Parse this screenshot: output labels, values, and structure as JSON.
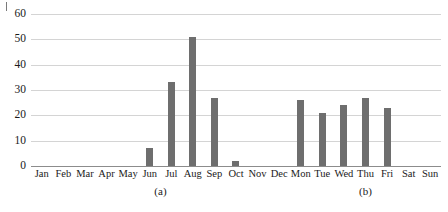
{
  "chart_data": {
    "type": "bar",
    "title": "",
    "subtitle": "",
    "xlabel": "",
    "ylabel": "",
    "ylim": [
      0,
      60
    ],
    "yticks": [
      0,
      10,
      20,
      30,
      40,
      50,
      60
    ],
    "ytick_labels": [
      "0",
      "10",
      "20",
      "30",
      "40",
      "50",
      "60"
    ],
    "grid": true,
    "legend": "none",
    "bar_color": "#6e6e6e",
    "gridline_color": "#d4d4d4",
    "axis_color": "#8c8c8c",
    "categories": [
      "Jan",
      "Feb",
      "Mar",
      "Apr",
      "May",
      "Jun",
      "Jul",
      "Aug",
      "Sep",
      "Oct",
      "Nov",
      "Dec",
      "Mon",
      "Tue",
      "Wed",
      "Thu",
      "Fri",
      "Sat",
      "Sun"
    ],
    "values": [
      0,
      0,
      0,
      0,
      0,
      7,
      33,
      51,
      27,
      2,
      0,
      0,
      26,
      21,
      24,
      27,
      23,
      0,
      0
    ],
    "groups": [
      {
        "caption": "(a)",
        "categories": [
          "Jan",
          "Feb",
          "Mar",
          "Apr",
          "May",
          "Jun",
          "Jul",
          "Aug",
          "Sep",
          "Oct",
          "Nov",
          "Dec"
        ],
        "center_index": 5.5
      },
      {
        "caption": "(b)",
        "categories": [
          "Mon",
          "Tue",
          "Wed",
          "Thu",
          "Fri",
          "Sat",
          "Sun"
        ],
        "center_index": 15.0
      }
    ]
  }
}
